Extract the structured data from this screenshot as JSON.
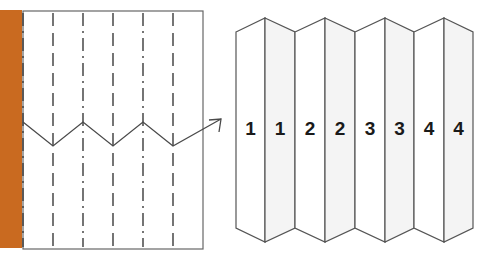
{
  "figure": {
    "background_color": "#ffffff",
    "stroke_color": "#555555",
    "text_color": "#1a1a1a"
  },
  "left_panel": {
    "name": "pleated-section-cross-view",
    "frame": {
      "x": 23,
      "y": 11,
      "width": 180,
      "height": 238
    },
    "border_color": "#666666",
    "light_source_bar": {
      "label": "orange-light-source-bar",
      "color": "#c96a20",
      "x": 0,
      "y": 10,
      "width": 22,
      "height": 238
    },
    "fold_lines": [
      {
        "x": 23,
        "style": "dash-dot"
      },
      {
        "x": 53,
        "style": "dashed"
      },
      {
        "x": 83,
        "style": "dash-dot"
      },
      {
        "x": 113,
        "style": "dashed"
      },
      {
        "x": 143,
        "style": "dash-dot"
      },
      {
        "x": 173,
        "style": "dashed"
      }
    ],
    "ray_path": {
      "label": "zigzag-light-ray",
      "points": "23,122 53,146 83,122 113,146 143,122 173,146 221,119",
      "arrow_tip": {
        "x": 221,
        "y": 119
      },
      "color": "#4a4a4a"
    }
  },
  "right_panel": {
    "name": "accordion-fold-panels",
    "frame": {
      "x": 236,
      "y": 14,
      "width": 237,
      "height": 232
    },
    "panel_fill_front": "#ffffff",
    "panel_fill_back": "#f4f4f4",
    "stroke_color": "#555555",
    "panels": [
      {
        "index": 0,
        "label": "1",
        "orientation": "front",
        "x_left": 236,
        "x_right": 265,
        "top_left_y": 32,
        "top_right_y": 18,
        "bottom_left_y": 228,
        "bottom_right_y": 242
      },
      {
        "index": 1,
        "label": "1",
        "orientation": "back",
        "x_left": 265,
        "x_right": 295,
        "top_left_y": 18,
        "top_right_y": 32,
        "bottom_left_y": 242,
        "bottom_right_y": 228
      },
      {
        "index": 2,
        "label": "2",
        "orientation": "front",
        "x_left": 295,
        "x_right": 325,
        "top_left_y": 32,
        "top_right_y": 18,
        "bottom_left_y": 228,
        "bottom_right_y": 242
      },
      {
        "index": 3,
        "label": "2",
        "orientation": "back",
        "x_left": 325,
        "x_right": 355,
        "top_left_y": 18,
        "top_right_y": 32,
        "bottom_left_y": 242,
        "bottom_right_y": 228
      },
      {
        "index": 4,
        "label": "3",
        "orientation": "front",
        "x_left": 355,
        "x_right": 385,
        "top_left_y": 32,
        "top_right_y": 18,
        "bottom_left_y": 228,
        "bottom_right_y": 242
      },
      {
        "index": 5,
        "label": "3",
        "orientation": "back",
        "x_left": 385,
        "x_right": 414,
        "top_left_y": 18,
        "top_right_y": 32,
        "bottom_left_y": 242,
        "bottom_right_y": 228
      },
      {
        "index": 6,
        "label": "4",
        "orientation": "front",
        "x_left": 414,
        "x_right": 444,
        "top_left_y": 32,
        "top_right_y": 18,
        "bottom_left_y": 228,
        "bottom_right_y": 242
      },
      {
        "index": 7,
        "label": "4",
        "orientation": "back",
        "x_left": 444,
        "x_right": 473,
        "top_left_y": 18,
        "top_right_y": 32,
        "bottom_left_y": 242,
        "bottom_right_y": 228
      }
    ],
    "number_baseline_y": 130
  }
}
